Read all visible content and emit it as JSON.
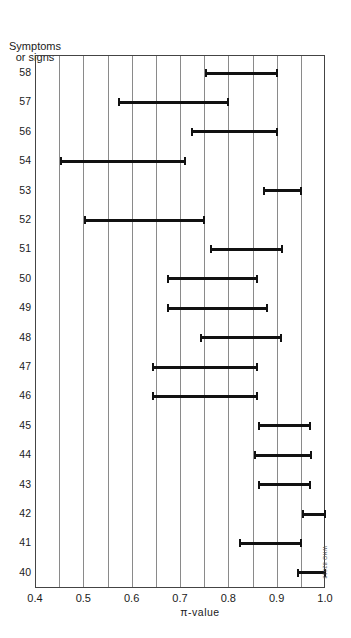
{
  "chart_data": {
    "type": "range-bar",
    "title": "",
    "ylabel": [
      "Symptoms",
      "or signs"
    ],
    "xlabel": "π-value",
    "xlim": [
      0.4,
      1.0
    ],
    "xticks": [
      "0.4",
      "0.5",
      "0.6",
      "0.7",
      "0.8",
      "0.9",
      "1.0"
    ],
    "grid_step": 0.05,
    "grid": true,
    "categories": [
      "58",
      "57",
      "56",
      "54",
      "53",
      "52",
      "51",
      "50",
      "49",
      "48",
      "47",
      "46",
      "45",
      "44",
      "43",
      "42",
      "41",
      "40"
    ],
    "ranges": [
      {
        "label": "58",
        "low": 0.75,
        "high": 0.9
      },
      {
        "label": "57",
        "low": 0.57,
        "high": 0.8
      },
      {
        "label": "56",
        "low": 0.72,
        "high": 0.9
      },
      {
        "label": "54",
        "low": 0.45,
        "high": 0.71
      },
      {
        "label": "53",
        "low": 0.87,
        "high": 0.95
      },
      {
        "label": "52",
        "low": 0.5,
        "high": 0.75
      },
      {
        "label": "51",
        "low": 0.76,
        "high": 0.91
      },
      {
        "label": "50",
        "low": 0.67,
        "high": 0.86
      },
      {
        "label": "49",
        "low": 0.67,
        "high": 0.88
      },
      {
        "label": "48",
        "low": 0.74,
        "high": 0.91
      },
      {
        "label": "47",
        "low": 0.64,
        "high": 0.86
      },
      {
        "label": "46",
        "low": 0.64,
        "high": 0.86
      },
      {
        "label": "45",
        "low": 0.86,
        "high": 0.97
      },
      {
        "label": "44",
        "low": 0.85,
        "high": 0.97
      },
      {
        "label": "43",
        "low": 0.86,
        "high": 0.97
      },
      {
        "label": "42",
        "low": 0.95,
        "high": 1.0
      },
      {
        "label": "41",
        "low": 0.82,
        "high": 0.95
      },
      {
        "label": "40",
        "low": 0.94,
        "high": 1.0
      }
    ],
    "annotation": "WHO 82618",
    "colors": {
      "bar": "#111111",
      "grid": "#8a8a8a",
      "frame": "#444444"
    }
  }
}
